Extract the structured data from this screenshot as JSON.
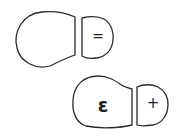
{
  "diagram": {
    "footprints": [
      {
        "id": "upper",
        "sole_symbol": "",
        "heel_symbol": "="
      },
      {
        "id": "lower",
        "sole_symbol": "ε",
        "heel_symbol": "+"
      }
    ]
  },
  "colors": {
    "stroke": "#2a2a2a",
    "background": "#ffffff"
  }
}
